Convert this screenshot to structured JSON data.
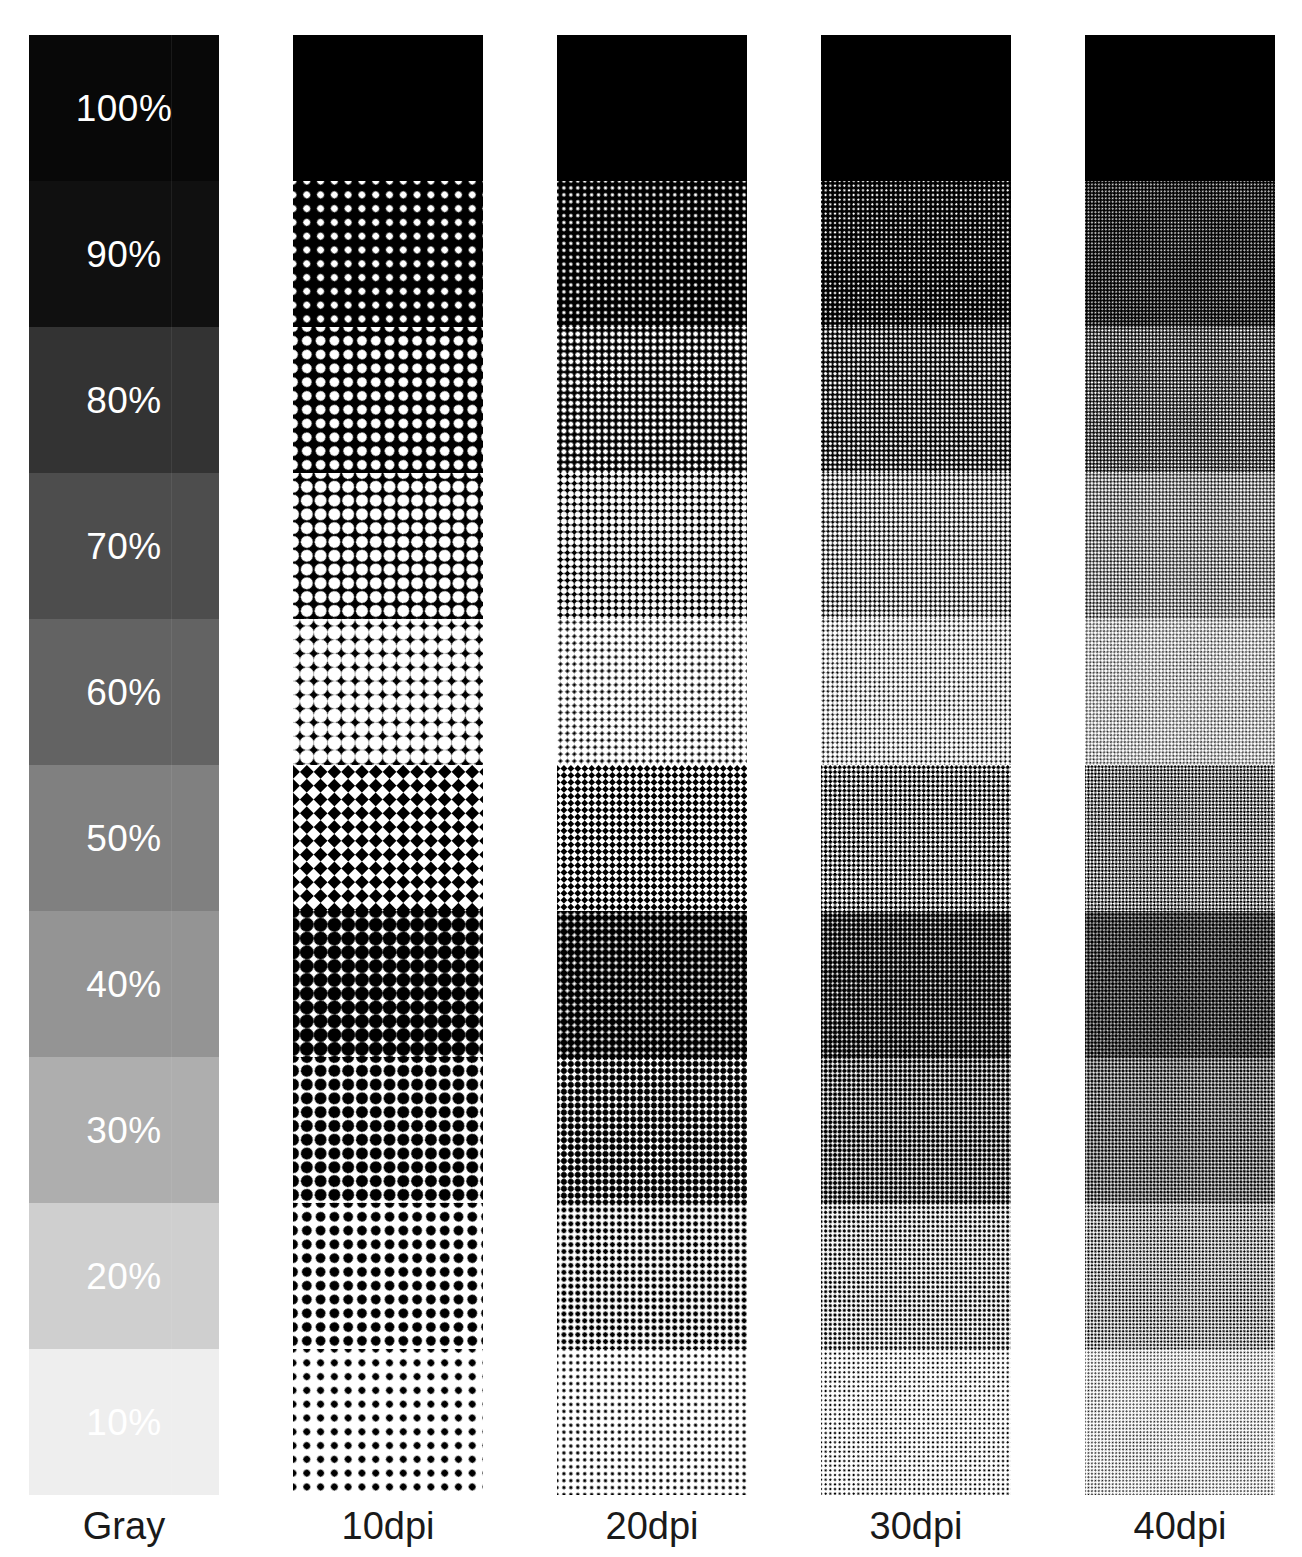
{
  "figure": {
    "background_color": "#ffffff",
    "text_color": "#1a1a1a",
    "label_color": "#ffffff"
  },
  "columns": [
    {
      "id": "gray",
      "caption": "Gray",
      "type": "continuous-tone",
      "x": 29,
      "width": 190,
      "dpi": null
    },
    {
      "id": "dpi10",
      "caption": "10dpi",
      "type": "halftone",
      "x": 293,
      "width": 190,
      "dpi": 10,
      "cell_px": 19.5
    },
    {
      "id": "dpi20",
      "caption": "20dpi",
      "type": "halftone",
      "x": 557,
      "width": 190,
      "dpi": 20,
      "cell_px": 9.8
    },
    {
      "id": "dpi30",
      "caption": "30dpi",
      "type": "halftone",
      "x": 821,
      "width": 190,
      "dpi": 30,
      "cell_px": 6.6
    },
    {
      "id": "dpi40",
      "caption": "40dpi",
      "type": "halftone",
      "x": 1085,
      "width": 190,
      "dpi": 40,
      "cell_px": 4.9
    }
  ],
  "chart_data": {
    "type": "table",
    "xlabel": "",
    "ylabel": "Tone value",
    "categories": [
      "Gray",
      "10dpi",
      "20dpi",
      "30dpi",
      "40dpi"
    ],
    "legend": [
      "Gray",
      "10dpi",
      "20dpi",
      "30dpi",
      "40dpi"
    ],
    "tone_labels": [
      "100%",
      "90%",
      "80%",
      "70%",
      "60%",
      "50%",
      "40%",
      "30%",
      "20%",
      "10%"
    ],
    "tone_values": [
      100,
      90,
      80,
      70,
      60,
      50,
      40,
      30,
      20,
      10
    ],
    "gray_levels_hex": [
      "#080808",
      "#101010",
      "#333333",
      "#4d4d4d",
      "#636363",
      "#808080",
      "#949494",
      "#aeaeae",
      "#cfcfcf",
      "#eeeeee"
    ],
    "band_top_px": 35,
    "band_height_px": 146,
    "column_height_px": 1460,
    "grid": false,
    "legend_position": "bottom"
  },
  "bands": [
    {
      "label": "100%",
      "value": 100,
      "gray": "#080808",
      "top": 35,
      "height": 146
    },
    {
      "label": "90%",
      "value": 90,
      "gray": "#101010",
      "top": 181,
      "height": 146
    },
    {
      "label": "80%",
      "value": 80,
      "gray": "#333333",
      "top": 327,
      "height": 146
    },
    {
      "label": "70%",
      "value": 70,
      "gray": "#4d4d4d",
      "top": 473,
      "height": 146
    },
    {
      "label": "60%",
      "value": 60,
      "gray": "#636363",
      "top": 619,
      "height": 146
    },
    {
      "label": "50%",
      "value": 50,
      "gray": "#808080",
      "top": 765,
      "height": 146
    },
    {
      "label": "40%",
      "value": 40,
      "gray": "#949494",
      "top": 911,
      "height": 146
    },
    {
      "label": "30%",
      "value": 30,
      "gray": "#aeaeae",
      "top": 1057,
      "height": 146
    },
    {
      "label": "20%",
      "value": 20,
      "gray": "#cfcfcf",
      "top": 1203,
      "height": 146
    },
    {
      "label": "10%",
      "value": 10,
      "gray": "#eeeeee",
      "top": 1349,
      "height": 146
    }
  ],
  "captions": {
    "gray": "Gray",
    "dpi10": "10dpi",
    "dpi20": "20dpi",
    "dpi30": "30dpi",
    "dpi40": "40dpi"
  }
}
